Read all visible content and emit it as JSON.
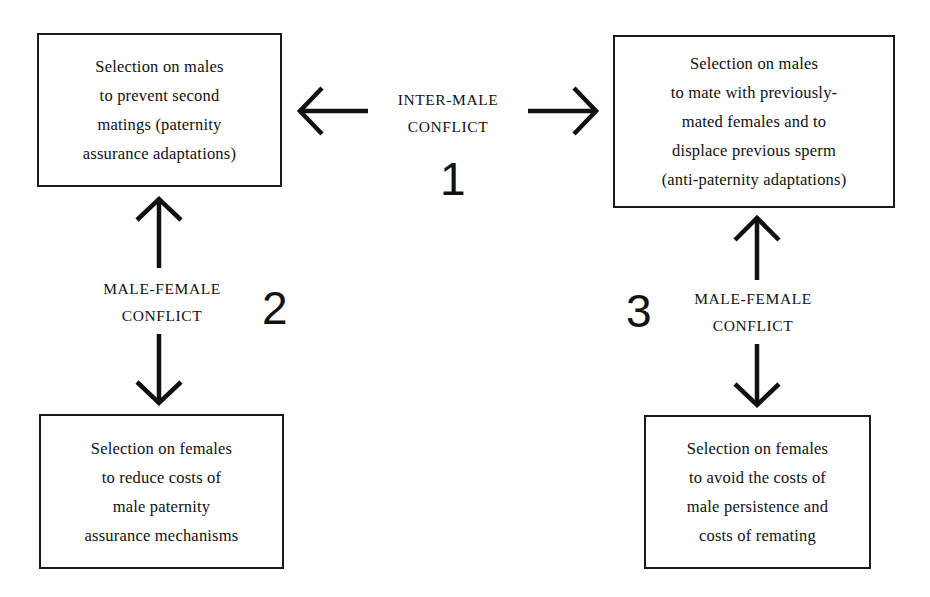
{
  "diagram": {
    "type": "conflict-diagram",
    "boxes": {
      "top_left": {
        "lines": [
          "Selection on males",
          "to prevent second",
          "matings (paternity",
          "assurance adaptations)"
        ]
      },
      "top_right": {
        "lines": [
          "Selection on males",
          "to mate with previously-",
          "mated females and to",
          "displace previous sperm",
          "(anti-paternity adaptations)"
        ]
      },
      "bottom_left": {
        "lines": [
          "Selection on females",
          "to reduce costs of",
          "male paternity",
          "assurance mechanisms"
        ]
      },
      "bottom_right": {
        "lines": [
          "Selection on females",
          "to avoid the costs of",
          "male persistence and",
          "costs of remating"
        ]
      }
    },
    "conflicts": [
      {
        "number": "1",
        "lines": [
          "INTER-MALE",
          "CONFLICT"
        ],
        "connects": [
          "top_left",
          "top_right"
        ],
        "direction": "horizontal-bidirectional"
      },
      {
        "number": "2",
        "lines": [
          "MALE-FEMALE",
          "CONFLICT"
        ],
        "connects": [
          "top_left",
          "bottom_left"
        ],
        "direction": "vertical-bidirectional"
      },
      {
        "number": "3",
        "lines": [
          "MALE-FEMALE",
          "CONFLICT"
        ],
        "connects": [
          "top_right",
          "bottom_right"
        ],
        "direction": "vertical-bidirectional"
      }
    ],
    "colors": {
      "ink": "#111111",
      "background": "#ffffff"
    }
  }
}
